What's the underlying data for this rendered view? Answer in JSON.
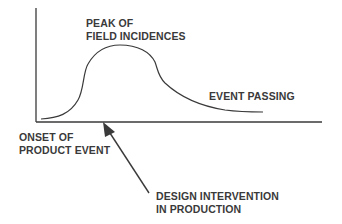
{
  "diagram": {
    "type": "lifecycle-curve",
    "colors": {
      "line": "#3a3a3a",
      "text": "#3a3a3a",
      "background": "#ffffff"
    },
    "labels": {
      "peak_line1": "PEAK OF",
      "peak_line2": "FIELD INCIDENCES",
      "passing": "EVENT PASSING",
      "onset_line1": "ONSET OF",
      "onset_line2": "PRODUCT EVENT",
      "intervention_line1": "DESIGN INTERVENTION",
      "intervention_line2": "IN PRODUCTION"
    },
    "axes": {
      "x_axis": "time (unlabeled)",
      "y_axis": "field incidences (unlabeled)"
    },
    "phases": [
      "ONSET OF PRODUCT EVENT",
      "PEAK OF FIELD INCIDENCES",
      "EVENT PASSING"
    ],
    "annotation_arrow": "DESIGN INTERVENTION IN PRODUCTION points to x-axis shortly after onset"
  }
}
